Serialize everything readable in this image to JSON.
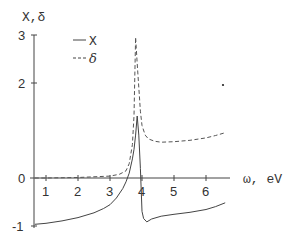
{
  "chart_data": {
    "type": "line",
    "title": "",
    "xlabel": "ω, eV",
    "ylabel": "X,δ",
    "xlim": [
      0.63,
      6.7
    ],
    "ylim": [
      -1.05,
      3.0
    ],
    "x_ticks": [
      1,
      2,
      3,
      4,
      5,
      6
    ],
    "y_ticks": [
      -1,
      0,
      1,
      2,
      3
    ],
    "grid": false,
    "legend": {
      "position": "upper-left",
      "entries": [
        {
          "name": "X",
          "style": "solid"
        },
        {
          "name": "δ",
          "style": "dashed"
        }
      ]
    },
    "series": [
      {
        "name": "X",
        "style": "solid",
        "color": "#444444",
        "x": [
          0.65,
          1.0,
          1.5,
          2.0,
          2.5,
          2.8,
          3.0,
          3.2,
          3.4,
          3.5,
          3.6,
          3.7,
          3.75,
          3.8,
          3.85,
          3.9,
          3.95,
          4.0,
          4.05,
          4.15,
          4.3,
          4.6,
          5.0,
          5.5,
          6.0,
          6.3,
          6.6
        ],
        "values": [
          -0.97,
          -0.95,
          -0.9,
          -0.83,
          -0.73,
          -0.64,
          -0.56,
          -0.42,
          -0.22,
          -0.08,
          0.1,
          0.4,
          0.6,
          0.9,
          1.3,
          0.9,
          0.2,
          -0.7,
          -0.85,
          -0.92,
          -0.86,
          -0.8,
          -0.76,
          -0.72,
          -0.66,
          -0.6,
          -0.52
        ]
      },
      {
        "name": "δ",
        "style": "dashed",
        "color": "#444444",
        "x": [
          0.65,
          1.0,
          2.0,
          3.0,
          3.3,
          3.5,
          3.6,
          3.7,
          3.75,
          3.8,
          3.85,
          3.9,
          3.95,
          4.0,
          4.1,
          4.2,
          4.4,
          4.6,
          5.0,
          5.5,
          6.0,
          6.3,
          6.6
        ],
        "values": [
          0.0,
          0.0,
          0.01,
          0.04,
          0.08,
          0.15,
          0.3,
          0.7,
          1.3,
          2.95,
          2.4,
          1.9,
          1.4,
          1.1,
          0.9,
          0.82,
          0.77,
          0.75,
          0.76,
          0.79,
          0.84,
          0.89,
          0.95
        ]
      }
    ],
    "annotations": [
      "stray dot near (6.6, 1.95)"
    ]
  },
  "axes": {
    "y_label": "X,δ",
    "x_label": "ω, eV",
    "x_tick_labels": [
      "1",
      "2",
      "3",
      "4",
      "5",
      "6"
    ],
    "y_tick_labels": [
      "-1",
      "0",
      "2",
      "3"
    ]
  },
  "legend": {
    "solid_label": "X",
    "dashed_label": "δ"
  },
  "layout": {
    "origin_px": [
      14,
      178
    ],
    "px_per_x": 32,
    "px_per_y": 47.7,
    "axis_x_px": 34,
    "axis_x_end_px": 230,
    "axis_y_top_px": 35,
    "axis_y_bottom_px": 228
  }
}
